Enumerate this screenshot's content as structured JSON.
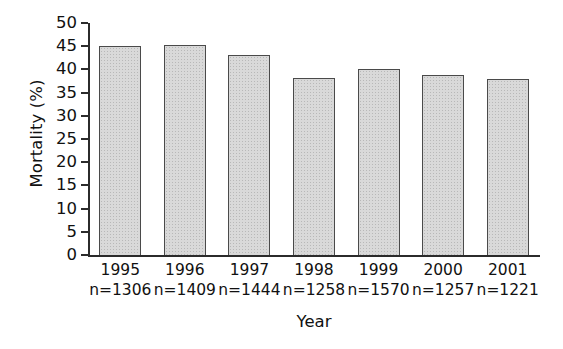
{
  "chart_data": {
    "type": "bar",
    "title": "",
    "subtitle": "",
    "xlabel": "Year",
    "ylabel": "Mortality (%)",
    "categories": [
      "1995",
      "1996",
      "1997",
      "1998",
      "1999",
      "2000",
      "2001"
    ],
    "group_sizes": [
      "n=1306",
      "n=1409",
      "n=1444",
      "n=1258",
      "n=1570",
      "n=1257",
      "n=1221"
    ],
    "values": [
      45,
      45.3,
      43,
      38.2,
      40,
      38.8,
      38
    ],
    "ylim": [
      0,
      50
    ],
    "ytick_step": 5,
    "yticks": [
      "50",
      "45",
      "40",
      "35",
      "30",
      "25",
      "20",
      "15",
      "10",
      "5",
      "0"
    ],
    "grid": false,
    "legend": "none",
    "bar_color": "#d9d9d9",
    "bar_edge_color": "#4a4a4a",
    "axis_color": "#2b2b2b"
  }
}
